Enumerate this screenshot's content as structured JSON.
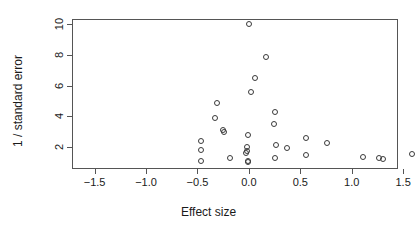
{
  "chart_data": {
    "type": "scatter",
    "title": "",
    "xlabel": "Effect size",
    "ylabel": "1 / standard error",
    "xlim": [
      -1.72,
      1.45
    ],
    "ylim": [
      0.55,
      10.35
    ],
    "xticks": [
      -1.5,
      -1.0,
      -0.5,
      0.0,
      0.5,
      1.0,
      1.5
    ],
    "xticklabels": [
      "-1.5",
      "-1.0",
      "-0.5",
      "0.0",
      "0.5",
      "1.0",
      "1.5"
    ],
    "yticks": [
      2,
      4,
      6,
      8,
      10
    ],
    "yticklabels": [
      "2",
      "4",
      "6",
      "8",
      "10"
    ],
    "grid": false,
    "legend": null,
    "marker": "open-circle",
    "marker_color": "#3a3a3a",
    "points": [
      {
        "x": 0.0,
        "y": 10.0
      },
      {
        "x": 0.17,
        "y": 7.9
      },
      {
        "x": 0.06,
        "y": 6.5
      },
      {
        "x": 0.02,
        "y": 5.55
      },
      {
        "x": -0.31,
        "y": 4.85
      },
      {
        "x": 0.25,
        "y": 4.25
      },
      {
        "x": -0.33,
        "y": 3.85
      },
      {
        "x": 0.24,
        "y": 3.5
      },
      {
        "x": -0.25,
        "y": 3.1
      },
      {
        "x": -0.24,
        "y": 2.95
      },
      {
        "x": -0.01,
        "y": 2.75
      },
      {
        "x": 0.56,
        "y": 2.55
      },
      {
        "x": -0.47,
        "y": 2.38
      },
      {
        "x": 0.76,
        "y": 2.22
      },
      {
        "x": 0.26,
        "y": 2.12
      },
      {
        "x": -0.02,
        "y": 2.02
      },
      {
        "x": 0.37,
        "y": 1.9
      },
      {
        "x": -0.47,
        "y": 1.8
      },
      {
        "x": -0.02,
        "y": 1.74
      },
      {
        "x": -0.03,
        "y": 1.62
      },
      {
        "x": 0.56,
        "y": 1.48
      },
      {
        "x": 1.59,
        "y": 1.52
      },
      {
        "x": 1.11,
        "y": 1.36
      },
      {
        "x": 1.27,
        "y": 1.25
      },
      {
        "x": 1.3,
        "y": 1.2
      },
      {
        "x": -0.18,
        "y": 1.25
      },
      {
        "x": 0.25,
        "y": 1.25
      },
      {
        "x": -0.47,
        "y": 1.1
      },
      {
        "x": -0.01,
        "y": 1.05
      },
      {
        "x": -0.01,
        "y": 0.98
      }
    ]
  }
}
